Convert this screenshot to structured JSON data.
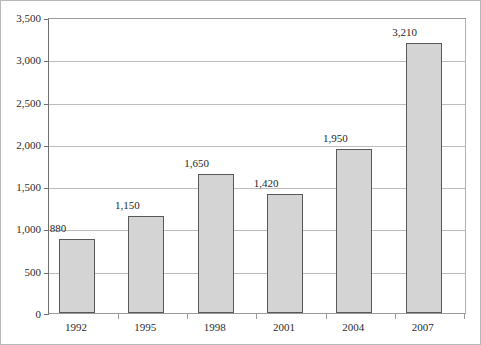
{
  "chart_data": {
    "type": "bar",
    "title": "",
    "subtitle": "",
    "xlabel": "",
    "ylabel": "",
    "categories": [
      "1992",
      "1995",
      "1998",
      "2001",
      "2004",
      "2007"
    ],
    "values": [
      880,
      1150,
      1650,
      1420,
      1950,
      3210
    ],
    "value_labels": [
      "880",
      "1,150",
      "1,650",
      "1,420",
      "1,950",
      "3,210"
    ],
    "ylim": [
      0,
      3500
    ],
    "ytick_values": [
      0,
      500,
      1000,
      1500,
      2000,
      2500,
      3000,
      3500
    ],
    "ytick_labels": [
      "0",
      "500",
      "1,000",
      "1,500",
      "2,000",
      "2,500",
      "3,000",
      "3,500"
    ],
    "grid": true,
    "legend": false,
    "legend_position": "none",
    "bar_color": "#d4d4d4",
    "bar_border_color": "#585858",
    "gridline_color": "#bcbcbc",
    "axis_color": "#6e6e6e",
    "text_color": "#2b2b2b",
    "background_color": "#ffffff"
  }
}
